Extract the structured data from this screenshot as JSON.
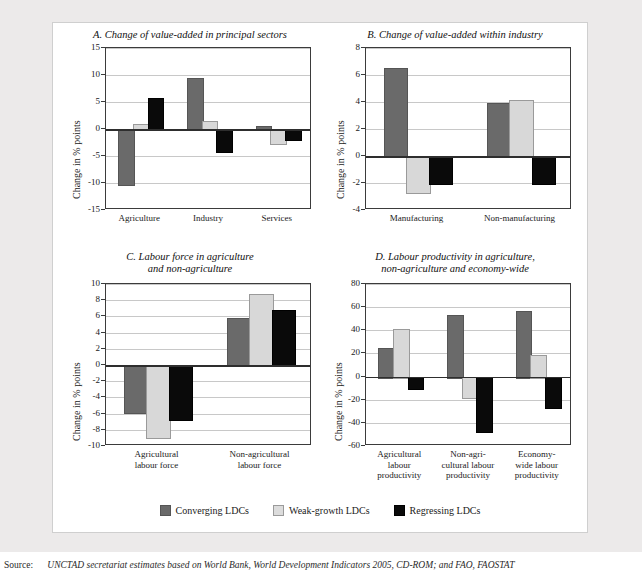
{
  "figure": {
    "background_color": "#eceaea",
    "card_color": "#ffffff",
    "series_colors": [
      "#6a6a6a",
      "#d8d8d8",
      "#0a0a0a"
    ]
  },
  "legend": {
    "items": [
      {
        "label": "Converging LDCs",
        "color": "#6a6a6a"
      },
      {
        "label": "Weak-growth LDCs",
        "color": "#d8d8d8"
      },
      {
        "label": "Regressing LDCs",
        "color": "#0a0a0a"
      }
    ]
  },
  "source": {
    "label": "Source:",
    "text": "UNCTAD secretariat estimates based on World Bank, World Development Indicators 2005, CD-ROM; and FAO, FAOSTAT"
  },
  "chart_data": [
    {
      "id": "A",
      "type": "bar",
      "title": "A. Change of value-added in principal sectors",
      "xlabel": "",
      "ylabel": "Change in % points",
      "ylim": [
        -15,
        15
      ],
      "yticks": [
        15,
        10,
        5,
        0,
        -5,
        -10,
        -15
      ],
      "grid": true,
      "legend_position": "bottom-shared",
      "categories": [
        "Agriculture",
        "Industry",
        "Services"
      ],
      "series": [
        {
          "name": "Converging LDCs",
          "values": [
            -10.2,
            9.4,
            0.6
          ]
        },
        {
          "name": "Weak-growth LDCs",
          "values": [
            0.9,
            1.4,
            -2.5
          ]
        },
        {
          "name": "Regressing LDCs",
          "values": [
            5.8,
            -4.0,
            -1.8
          ]
        }
      ]
    },
    {
      "id": "B",
      "type": "bar",
      "title": "B. Change of value-added within industry",
      "xlabel": "",
      "ylabel": "Change in % points",
      "ylim": [
        -4,
        8
      ],
      "yticks": [
        8,
        6,
        4,
        2,
        0,
        -2,
        -4
      ],
      "grid": true,
      "legend_position": "bottom-shared",
      "categories": [
        "Manufacturing",
        "Non-manufacturing"
      ],
      "series": [
        {
          "name": "Converging LDCs",
          "values": [
            6.55,
            3.9
          ]
        },
        {
          "name": "Weak-growth LDCs",
          "values": [
            -2.7,
            4.15
          ]
        },
        {
          "name": "Regressing LDCs",
          "values": [
            -2.0,
            -2.0
          ]
        }
      ]
    },
    {
      "id": "C",
      "type": "bar",
      "title": "C. Labour force in agriculture\nand non-agriculture",
      "xlabel": "",
      "ylabel": "Change in % points",
      "ylim": [
        -10,
        10
      ],
      "yticks": [
        10,
        8,
        6,
        4,
        2,
        0,
        -2,
        -4,
        -6,
        -8,
        -10
      ],
      "grid": true,
      "legend_position": "bottom-shared",
      "categories": [
        "Agricultural\nlabour force",
        "Non-agricultural\nlabour force"
      ],
      "series": [
        {
          "name": "Converging LDCs",
          "values": [
            -5.8,
            5.8
          ]
        },
        {
          "name": "Weak-growth LDCs",
          "values": [
            -8.9,
            8.8
          ]
        },
        {
          "name": "Regressing LDCs",
          "values": [
            -6.7,
            6.8
          ]
        }
      ]
    },
    {
      "id": "D",
      "type": "bar",
      "title": "D. Labour productivity in agriculture,\nnon-agriculture and economy-wide",
      "xlabel": "",
      "ylabel": "Change in % points",
      "ylim": [
        -60,
        80
      ],
      "yticks": [
        80,
        60,
        40,
        20,
        0,
        -20,
        -40,
        -60
      ],
      "grid": true,
      "legend_position": "bottom-shared",
      "categories": [
        "Agricultural\nlabour\nproductivity",
        "Non-agri-\ncultural labour\nproductivity",
        "Economy-\nwide labour\nproductivity"
      ],
      "series": [
        {
          "name": "Converging LDCs",
          "values": [
            25,
            53,
            57
          ]
        },
        {
          "name": "Weak-growth LDCs",
          "values": [
            41,
            -18,
            18.5
          ]
        },
        {
          "name": "Regressing LDCs",
          "values": [
            -10,
            -47,
            -26
          ]
        }
      ]
    }
  ]
}
